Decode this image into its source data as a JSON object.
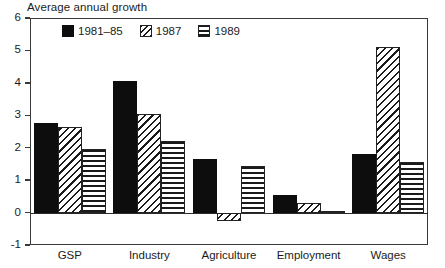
{
  "chart_data": {
    "type": "bar",
    "title": "Average annual growth",
    "xlabel": "",
    "ylabel": "",
    "ylim": [
      -1,
      6
    ],
    "yticks": [
      -1,
      0,
      1,
      2,
      3,
      4,
      5,
      6
    ],
    "ytick_labels": [
      "-1",
      "0",
      "1",
      "2",
      "3",
      "4",
      "5",
      "6"
    ],
    "grid": false,
    "legend_position": "top-left inside plot",
    "categories": [
      "GSP",
      "Industry",
      "Agriculture",
      "Employment",
      "Wages"
    ],
    "series": [
      {
        "name": "1981–85",
        "pattern": "solid-black",
        "values": [
          2.75,
          4.05,
          1.65,
          0.55,
          1.8
        ]
      },
      {
        "name": "1987",
        "pattern": "diagonal-hatch",
        "values": [
          2.65,
          3.05,
          -0.25,
          0.3,
          5.1
        ]
      },
      {
        "name": "1989",
        "pattern": "horizontal-lines",
        "values": [
          1.95,
          2.2,
          1.45,
          0.05,
          1.55
        ]
      }
    ]
  },
  "legend": {
    "entries": [
      {
        "label": "1981–85",
        "swatch": "solid-black-swatch"
      },
      {
        "label": "1987",
        "swatch": "diagonal-hatch-swatch"
      },
      {
        "label": "1989",
        "swatch": "horizontal-lines-swatch"
      }
    ]
  },
  "colors": {
    "series_fill": "#0d0d0d",
    "axis": "#3a3a3a",
    "background": "#ffffff",
    "text": "#1c1c1c"
  }
}
